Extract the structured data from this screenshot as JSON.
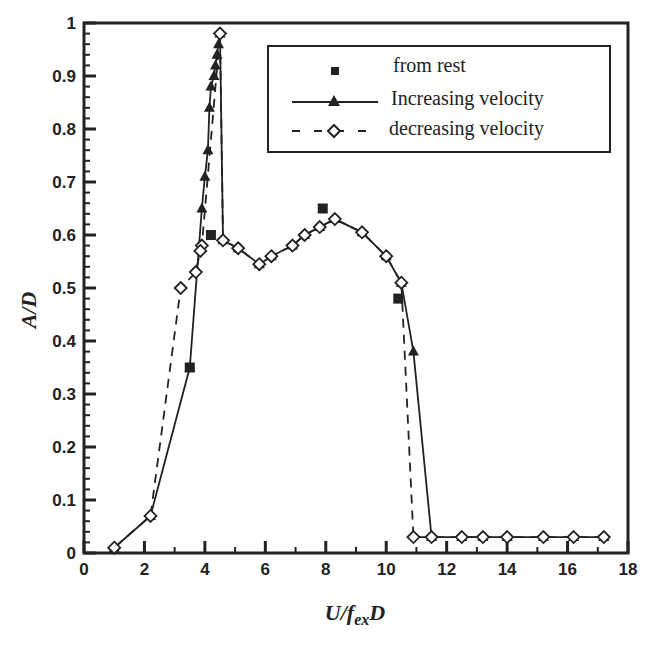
{
  "chart_data": {
    "type": "line",
    "title": "",
    "xlabel": "U/f_exD",
    "xlabel_main": "U/f",
    "xlabel_sub": "ex",
    "xlabel_tail": "D",
    "ylabel": "A/D",
    "xlim": [
      0,
      18
    ],
    "ylim": [
      0,
      1
    ],
    "x_ticks": [
      0,
      2,
      4,
      6,
      8,
      10,
      12,
      14,
      16,
      18
    ],
    "y_ticks": [
      0,
      0.1,
      0.2,
      0.3,
      0.4,
      0.5,
      0.6,
      0.7,
      0.8,
      0.9,
      1
    ],
    "y_tick_labels": [
      "0",
      "0.1",
      "0.2",
      "0.3",
      "0.4",
      "0.5",
      "0.6",
      "0.7",
      "0.8",
      "0.9",
      "1"
    ],
    "grid": false,
    "legend_position": "upper right",
    "series": [
      {
        "name": "from rest",
        "marker": "square-filled",
        "line": "none",
        "x": [
          3.5,
          4.2,
          7.9,
          10.4
        ],
        "y": [
          0.35,
          0.6,
          0.65,
          0.48
        ]
      },
      {
        "name": "Increasing velocity",
        "marker": "triangle-filled",
        "line": "solid",
        "x": [
          1.0,
          2.2,
          3.5,
          3.9,
          4.0,
          4.1,
          4.15,
          4.2,
          4.3,
          4.35,
          4.4,
          4.45,
          4.5,
          4.6,
          5.1,
          5.8,
          6.2,
          6.9,
          7.3,
          7.8,
          8.3,
          9.2,
          10.0,
          10.5,
          10.9,
          11.5,
          12.5,
          13.2,
          14.0,
          15.2,
          16.2,
          17.2
        ],
        "y": [
          0.01,
          0.07,
          0.35,
          0.65,
          0.71,
          0.76,
          0.84,
          0.88,
          0.9,
          0.92,
          0.94,
          0.96,
          0.98,
          0.59,
          0.575,
          0.545,
          0.56,
          0.58,
          0.6,
          0.615,
          0.63,
          0.605,
          0.56,
          0.51,
          0.38,
          0.03,
          0.03,
          0.03,
          0.03,
          0.03,
          0.03,
          0.03
        ]
      },
      {
        "name": "decreasing velocity",
        "marker": "diamond-open",
        "line": "dashed",
        "x": [
          17.2,
          16.2,
          15.2,
          14.0,
          13.2,
          12.5,
          11.5,
          10.9,
          10.5,
          10.0,
          9.2,
          8.3,
          7.8,
          7.3,
          6.9,
          6.2,
          5.8,
          5.1,
          4.6,
          4.5,
          3.9,
          3.85,
          3.7,
          3.2,
          2.2,
          1.0
        ],
        "y": [
          0.03,
          0.03,
          0.03,
          0.03,
          0.03,
          0.03,
          0.03,
          0.03,
          0.51,
          0.56,
          0.605,
          0.63,
          0.615,
          0.6,
          0.58,
          0.56,
          0.545,
          0.575,
          0.59,
          0.98,
          0.58,
          0.57,
          0.53,
          0.5,
          0.07,
          0.01
        ]
      }
    ]
  },
  "legend": {
    "items": [
      {
        "label": "from rest"
      },
      {
        "label": "Increasing velocity"
      },
      {
        "label": "decreasing velocity"
      }
    ]
  }
}
